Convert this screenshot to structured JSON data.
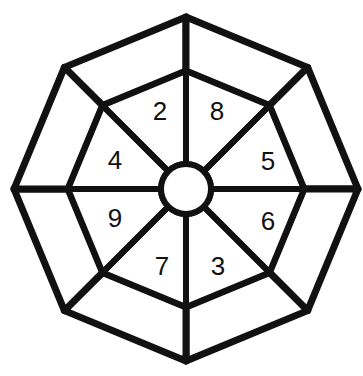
{
  "figure": {
    "name": "numbered-wheel-puzzle",
    "background_color": "#ffffff",
    "stroke_color": "#111111",
    "fill_color": "#ffffff",
    "digit_color": "#111111"
  },
  "geometry": {
    "center_x": 186,
    "center_y": 189,
    "hub_radius": 25,
    "inner_ring_radius": 118,
    "outer_ring_radius": 172,
    "spoke_count": 8,
    "spoke_angles_deg": [
      0,
      45,
      90,
      135,
      180,
      225,
      270,
      315
    ],
    "sector_count": 8,
    "outer_segment_count": 8,
    "rotation_offset_deg": 0
  },
  "chart_data": {
    "type": "pie",
    "title": "",
    "xlabel": "",
    "ylabel": "",
    "legend": "none",
    "grid": false,
    "categories": [
      "upper-left-of-top",
      "upper-right-of-top",
      "right-upper",
      "right-lower",
      "lower-right-of-bottom",
      "lower-left-of-bottom",
      "left-lower",
      "left-upper"
    ],
    "values": [
      2,
      8,
      5,
      6,
      3,
      7,
      9,
      4
    ],
    "labels": [
      "2",
      "8",
      "5",
      "6",
      "3",
      "7",
      "9",
      "4"
    ]
  },
  "inner_sectors": [
    {
      "id": "sector-2",
      "digit": "2",
      "start_angle_deg": 225,
      "end_angle_deg": 270,
      "label_x": 160,
      "label_y": 111
    },
    {
      "id": "sector-8",
      "digit": "8",
      "start_angle_deg": 270,
      "end_angle_deg": 315,
      "label_x": 217,
      "label_y": 111
    },
    {
      "id": "sector-5",
      "digit": "5",
      "start_angle_deg": 315,
      "end_angle_deg": 0,
      "label_x": 268,
      "label_y": 161
    },
    {
      "id": "sector-6",
      "digit": "6",
      "start_angle_deg": 0,
      "end_angle_deg": 45,
      "label_x": 268,
      "label_y": 221
    },
    {
      "id": "sector-3",
      "digit": "3",
      "start_angle_deg": 45,
      "end_angle_deg": 90,
      "label_x": 218,
      "label_y": 266
    },
    {
      "id": "sector-7",
      "digit": "7",
      "start_angle_deg": 90,
      "end_angle_deg": 135,
      "label_x": 162,
      "label_y": 266
    },
    {
      "id": "sector-9",
      "digit": "9",
      "start_angle_deg": 135,
      "end_angle_deg": 180,
      "label_x": 115,
      "label_y": 218
    },
    {
      "id": "sector-4",
      "digit": "4",
      "start_angle_deg": 180,
      "end_angle_deg": 225,
      "label_x": 115,
      "label_y": 160
    }
  ],
  "outer_segments": [
    {
      "id": "outer-segment-1",
      "digit": "",
      "start_angle_deg": 225,
      "end_angle_deg": 270
    },
    {
      "id": "outer-segment-2",
      "digit": "",
      "start_angle_deg": 270,
      "end_angle_deg": 315
    },
    {
      "id": "outer-segment-3",
      "digit": "",
      "start_angle_deg": 315,
      "end_angle_deg": 0
    },
    {
      "id": "outer-segment-4",
      "digit": "",
      "start_angle_deg": 0,
      "end_angle_deg": 45
    },
    {
      "id": "outer-segment-5",
      "digit": "",
      "start_angle_deg": 45,
      "end_angle_deg": 90
    },
    {
      "id": "outer-segment-6",
      "digit": "",
      "start_angle_deg": 90,
      "end_angle_deg": 135
    },
    {
      "id": "outer-segment-7",
      "digit": "",
      "start_angle_deg": 135,
      "end_angle_deg": 180
    },
    {
      "id": "outer-segment-8",
      "digit": "",
      "start_angle_deg": 180,
      "end_angle_deg": 225
    }
  ],
  "stroke_widths": {
    "outer_boundary": 7,
    "inner_ring": 6,
    "spoke": 6,
    "hub": 6
  }
}
